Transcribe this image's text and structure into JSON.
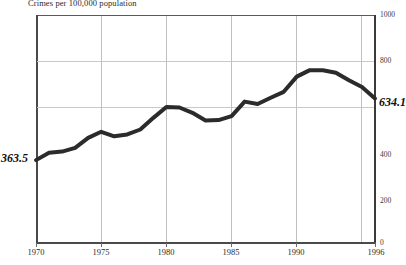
{
  "chart_data": {
    "type": "line",
    "title": "Crimes per 100,000 population",
    "xlabel": "",
    "ylabel": "",
    "xlim": [
      1970,
      1996
    ],
    "ylim": [
      0,
      1000
    ],
    "grid": "horizontal-at-600-and-800 plus vertical at 5-year ticks",
    "legend": "none",
    "x": [
      1970,
      1971,
      1972,
      1973,
      1974,
      1975,
      1976,
      1977,
      1978,
      1979,
      1980,
      1981,
      1982,
      1983,
      1984,
      1985,
      1986,
      1987,
      1988,
      1989,
      1990,
      1991,
      1992,
      1993,
      1994,
      1995,
      1996
    ],
    "values": [
      363.5,
      396.0,
      401.0,
      417.4,
      461.1,
      487.8,
      467.8,
      475.9,
      497.8,
      548.9,
      596.6,
      594.3,
      571.1,
      537.7,
      539.2,
      556.6,
      620.1,
      609.7,
      637.2,
      663.1,
      729.6,
      758.2,
      757.7,
      747.1,
      713.6,
      684.5,
      634.1
    ],
    "series": [
      {
        "name": "Violent crime rate",
        "values": [
          363.5,
          396.0,
          401.0,
          417.4,
          461.1,
          487.8,
          467.8,
          475.9,
          497.8,
          548.9,
          596.6,
          594.3,
          571.1,
          537.7,
          539.2,
          556.6,
          620.1,
          609.7,
          637.2,
          663.1,
          729.6,
          758.2,
          757.7,
          747.1,
          713.6,
          684.5,
          634.1
        ]
      }
    ],
    "y_ticks": [
      "0",
      "200",
      "400",
      "800",
      "1000"
    ],
    "y_tick_values": [
      0,
      200,
      400,
      800,
      1000
    ],
    "x_ticks": [
      "1970",
      "1975",
      "1980",
      "1985",
      "1990",
      "1996"
    ],
    "x_tick_values": [
      1970,
      1975,
      1980,
      1985,
      1990,
      1996
    ],
    "gridlines_y": [
      600,
      800
    ],
    "gridlines_x": [
      1975,
      1980,
      1985,
      1990,
      1995
    ],
    "annotations": [
      {
        "text": "363.5",
        "at_x": 1970,
        "at_y": 363.5,
        "position": "left-outside"
      },
      {
        "text": "634.1",
        "at_x": 1996,
        "at_y": 634.1,
        "position": "right-outside"
      }
    ],
    "line_color": "#2b2b2b",
    "line_width_px": 4,
    "axis_color": "#4a4a4a",
    "grid_color": "#c8c8c8",
    "background_color": "#ffffff"
  }
}
